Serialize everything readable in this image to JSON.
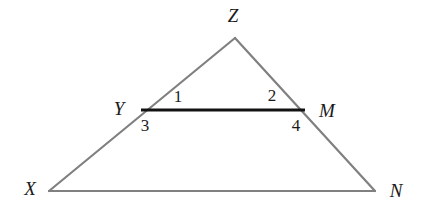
{
  "figure": {
    "type": "geometry-diagram",
    "canvas": {
      "width": 424,
      "height": 216,
      "background": "#ffffff"
    },
    "style": {
      "triangle_stroke": "#808080",
      "triangle_stroke_width": 2.2,
      "segment_stroke": "#121212",
      "segment_stroke_width": 3.2,
      "label_color": "#1a1a1a"
    },
    "points": {
      "Z": {
        "x": 235,
        "y": 38
      },
      "X": {
        "x": 49,
        "y": 191
      },
      "N": {
        "x": 375,
        "y": 191
      },
      "Y": {
        "x": 141,
        "y": 110
      },
      "M": {
        "x": 305,
        "y": 110
      }
    },
    "segments": [
      {
        "name": "side-XZ",
        "from": "X",
        "to": "Z",
        "style": "triangle"
      },
      {
        "name": "side-ZN",
        "from": "Z",
        "to": "N",
        "style": "triangle"
      },
      {
        "name": "side-XN",
        "from": "X",
        "to": "N",
        "style": "triangle"
      },
      {
        "name": "segment-YM",
        "from": "Y",
        "to": "M",
        "style": "segment"
      }
    ],
    "vertex_labels": [
      {
        "key": "Z",
        "text": "Z",
        "x": 233,
        "y": 15
      },
      {
        "key": "Y",
        "text": "Y",
        "x": 119,
        "y": 108
      },
      {
        "key": "M",
        "text": "M",
        "x": 327,
        "y": 110
      },
      {
        "key": "X",
        "text": "X",
        "x": 30,
        "y": 188
      },
      {
        "key": "N",
        "text": "N",
        "x": 396,
        "y": 190
      }
    ],
    "angle_labels": [
      {
        "key": "1",
        "text": "1",
        "x": 178,
        "y": 96
      },
      {
        "key": "2",
        "text": "2",
        "x": 272,
        "y": 95
      },
      {
        "key": "3",
        "text": "3",
        "x": 145,
        "y": 125
      },
      {
        "key": "4",
        "text": "4",
        "x": 296,
        "y": 125
      }
    ]
  }
}
